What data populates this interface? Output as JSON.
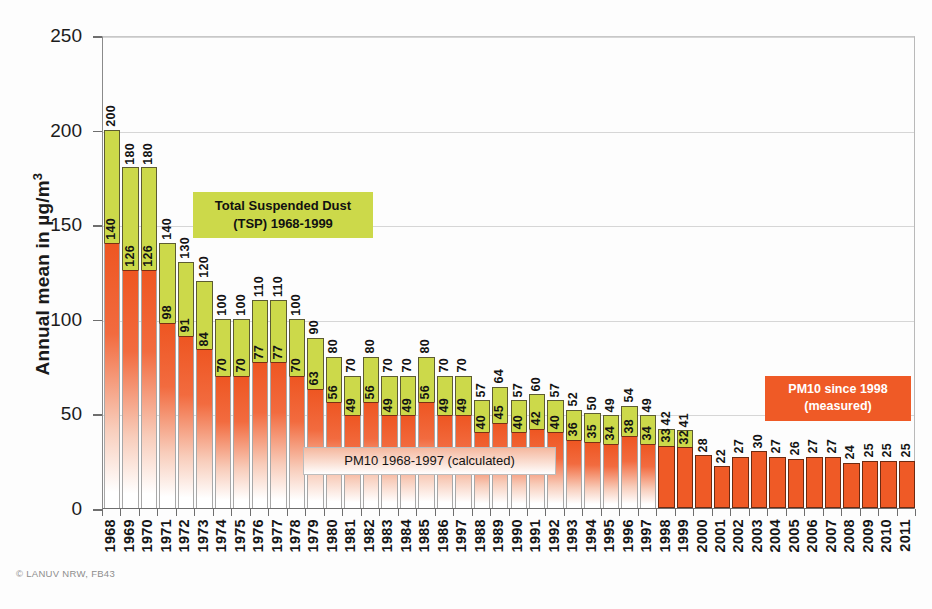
{
  "chart_data": {
    "type": "bar",
    "title": "",
    "subtitle": "",
    "xlabel": "",
    "ylabel": "Annual mean in µg/m³",
    "ylabel_unit_base": "Annual mean in µg/m",
    "ylabel_unit_exp": "3",
    "ylim": [
      0,
      250
    ],
    "yticks": [
      0,
      50,
      100,
      150,
      200,
      250
    ],
    "ytick_labels": [
      "0",
      "50",
      "100",
      "150",
      "200",
      "250"
    ],
    "grid": true,
    "legend_position": "inside-plot",
    "categories": [
      "1968",
      "1969",
      "1970",
      "1971",
      "1972",
      "1973",
      "1974",
      "1975",
      "1976",
      "1977",
      "1978",
      "1979",
      "1980",
      "1981",
      "1982",
      "1983",
      "1984",
      "1985",
      "1986",
      "1997",
      "1988",
      "1989",
      "1990",
      "1991",
      "1992",
      "1993",
      "1994",
      "1995",
      "1996",
      "1997",
      "1998",
      "1999",
      "2000",
      "2001",
      "2002",
      "2003",
      "2004",
      "2005",
      "2006",
      "2007",
      "2008",
      "2009",
      "2010",
      "2011"
    ],
    "series": [
      {
        "name": "Total Suspended Dust (TSP) 1968-1999",
        "color": "#ccd94a",
        "values": [
          200,
          180,
          180,
          140,
          130,
          120,
          100,
          100,
          110,
          110,
          100,
          90,
          80,
          70,
          80,
          70,
          70,
          80,
          70,
          70,
          57,
          64,
          57,
          60,
          57,
          52,
          50,
          49,
          54,
          49,
          42,
          41,
          null,
          null,
          null,
          null,
          null,
          null,
          null,
          null,
          null,
          null,
          null,
          null
        ]
      },
      {
        "name": "PM10 1968-1997 (calculated) / PM10 since 1998 (measured)",
        "color": "#ef5a26",
        "values": [
          140,
          126,
          126,
          98,
          91,
          84,
          70,
          70,
          77,
          77,
          70,
          63,
          56,
          49,
          56,
          49,
          49,
          56,
          49,
          49,
          40,
          45,
          40,
          42,
          40,
          36,
          35,
          34,
          38,
          34,
          33,
          32,
          28,
          22,
          27,
          30,
          27,
          26,
          27,
          27,
          24,
          25,
          25,
          25
        ]
      }
    ],
    "measured_from_index": 30,
    "annotations": [
      {
        "id": "tsp",
        "line1": "Total Suspended Dust",
        "line2": "(TSP) 1968-1999",
        "bg": "#ccd94a",
        "fg": "#111111"
      },
      {
        "id": "pm10-calculated",
        "line1": "PM10    1968-1997 (calculated)",
        "bg": "#f5b89f",
        "fg": "#141414"
      },
      {
        "id": "pm10-measured",
        "line1": "PM10 since 1998",
        "line2": "(measured)",
        "bg": "#ef5a26",
        "fg": "#ffffff"
      }
    ]
  },
  "credit": "© LANUV NRW, FB43"
}
